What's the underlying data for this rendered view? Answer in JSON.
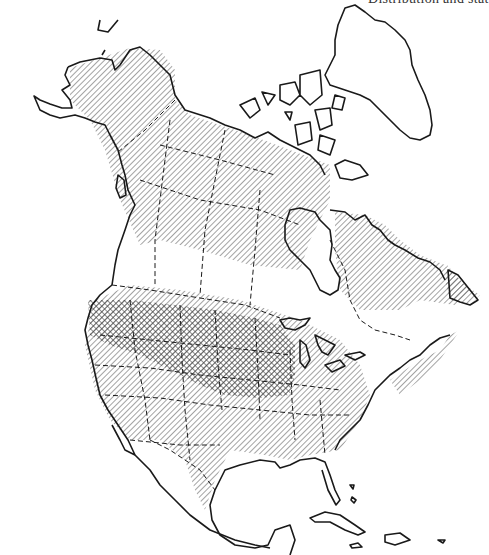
{
  "figure": {
    "type": "range-map",
    "region": "North America",
    "header_clipped_text": "Distribution and status",
    "legend": [
      {
        "pattern": "diagonal-hatch",
        "meaning": "range (lighter density)"
      },
      {
        "pattern": "cross-hatch",
        "meaning": "core range (higher density)"
      }
    ],
    "colors": {
      "ink": "#1a1a1a",
      "background": "#ffffff",
      "hatch": "#555555",
      "crosshatch": "#444444"
    }
  }
}
